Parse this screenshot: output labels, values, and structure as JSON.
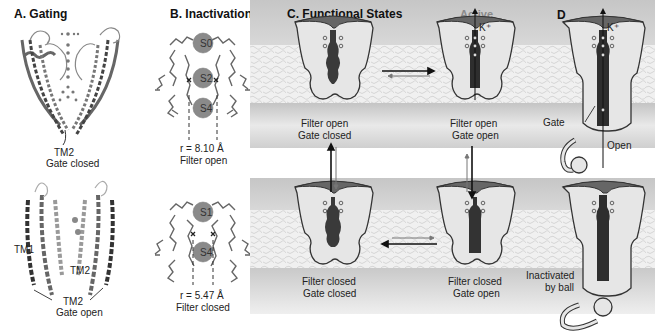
{
  "figure": {
    "panels": [
      {
        "id": "A",
        "title": "A. Gating",
        "structures": [
          {
            "state": "closed",
            "labels": [
              "TM2",
              "Gate closed"
            ]
          },
          {
            "state": "open",
            "labels": [
              "TM1",
              "TM2",
              "TM2",
              "Gate open"
            ]
          }
        ]
      },
      {
        "id": "B",
        "title": "B. Inactivation",
        "filters": [
          {
            "sites": [
              "S0",
              "S2",
              "S4"
            ],
            "radius": "r = 8.10 Å",
            "state": "Filter open"
          },
          {
            "sites": [
              "S1",
              "S4"
            ],
            "radius": "r = 5.47 Å",
            "state": "Filter closed"
          }
        ]
      },
      {
        "id": "C",
        "title": "C. Functional States",
        "active_label": "Active",
        "ion_label": "K⁺",
        "states": [
          {
            "line1": "Filter open",
            "line2": "Gate closed"
          },
          {
            "line1": "Filter open",
            "line2": "Gate open"
          },
          {
            "line1": "Filter closed",
            "line2": "Gate closed"
          },
          {
            "line1": "Filter closed",
            "line2": "Gate open"
          }
        ]
      },
      {
        "id": "D",
        "title": "D",
        "ion_label": "K⁺",
        "top_labels": {
          "gate": "Gate",
          "open": "Open"
        },
        "bottom_labels": {
          "line1": "Inactivated",
          "line2": "by ball"
        }
      }
    ],
    "colors": {
      "background": "#ffffff",
      "membrane_band": "#c8c8c8",
      "lipid": "#f2f2f2",
      "channel_body": "#e6e6e6",
      "pore": "#3a3a3a",
      "cap": "#6a6a6a",
      "active_text": "#8a8a8a"
    }
  }
}
